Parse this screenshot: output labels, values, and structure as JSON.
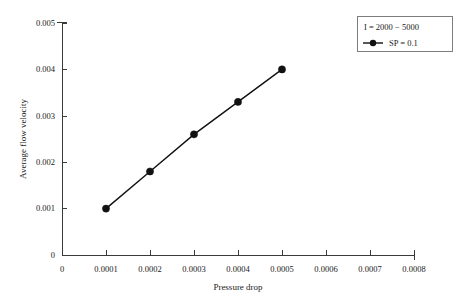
{
  "chart_data": {
    "type": "line",
    "title": "",
    "subtitle": "",
    "xlabel": "Pressure drop",
    "ylabel": "Average flow velocity",
    "x": [
      0.0001,
      0.0002,
      0.0003,
      0.0004,
      0.0005
    ],
    "series": [
      {
        "name": "SP = 0.1",
        "values": [
          0.001,
          0.0018,
          0.0026,
          0.0033,
          0.004
        ],
        "color": "#111111",
        "marker": "filled-circle"
      }
    ],
    "xlim": [
      0,
      0.0008
    ],
    "ylim": [
      0,
      0.005
    ],
    "xticks": [
      0,
      0.0001,
      0.0002,
      0.0003,
      0.0004,
      0.0005,
      0.0006,
      0.0007,
      0.0008
    ],
    "xtick_labels": [
      "0",
      "0.0001",
      "0.0002",
      "0.0003",
      "0.0004",
      "0.0005",
      "0.0006",
      "0.0007",
      "0.0008"
    ],
    "yticks": [
      0,
      0.001,
      0.002,
      0.003,
      0.004,
      0.005
    ],
    "ytick_labels": [
      "0",
      "0.001",
      "0.002",
      "0.003",
      "0.004",
      "0.005"
    ],
    "grid": false,
    "legend_position": "top-right",
    "legend": {
      "header": "I = 2000 − 5000",
      "entries": [
        "SP = 0.1"
      ]
    },
    "annotations": []
  },
  "axes": {
    "x_title": "Pressure drop",
    "y_title": "Average flow velocity"
  },
  "xtick": {
    "t0": "0",
    "t1": "0.0001",
    "t2": "0.0002",
    "t3": "0.0003",
    "t4": "0.0004",
    "t5": "0.0005",
    "t6": "0.0006",
    "t7": "0.0007",
    "t8": "0.0008"
  },
  "ytick": {
    "t0": "0",
    "t1": "0.001",
    "t2": "0.002",
    "t3": "0.003",
    "t4": "0.004",
    "t5": "0.005"
  },
  "legend": {
    "header": "I = 2000 − 5000",
    "entry1": "SP = 0.1"
  }
}
